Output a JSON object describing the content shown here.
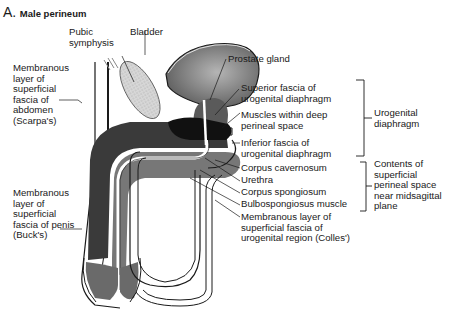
{
  "figure": {
    "letter": "A.",
    "title": "Male perineum"
  },
  "labels_left": {
    "pubic_symphysis": [
      "Pubic",
      "symphysis"
    ],
    "bladder": "Bladder",
    "scarpa": [
      "Membranous",
      "layer of",
      "superficial",
      "fascia of",
      "abdomen",
      "(Scarpa's)"
    ],
    "bucks": [
      "Membranous",
      "layer of",
      "superficial",
      "fascia of penis",
      "(Buck's)"
    ]
  },
  "labels_right": {
    "prostate": "Prostate gland",
    "superior_fascia": [
      "Superior fascia of",
      "urogenital diaphragm"
    ],
    "deep_muscles": [
      "Muscles within deep",
      "perineal space"
    ],
    "inferior_fascia": [
      "Inferior fascia of",
      "urogenital diaphragm"
    ],
    "corpus_cavernosum": "Corpus cavernosum",
    "urethra": "Urethra",
    "corpus_spongiosum": "Corpus spongiosum",
    "bulbospongiosus": "Bulbospongiosus muscle",
    "colles": [
      "Membranous layer of",
      "superficial fascia of",
      "urogenital region (Colles')"
    ]
  },
  "groups": {
    "urogenital_diaphragm": [
      "Urogenital",
      "diaphragm"
    ],
    "superficial_space": [
      "Contents of",
      "superficial",
      "perineal space",
      "near midsagittal",
      "plane"
    ]
  },
  "colors": {
    "bladder": "#6e6e6e",
    "prostate": "#5a5a5a",
    "deep_muscle": "#151515",
    "cavernosum": "#3a3a3a",
    "spongiosum": "#7a7a7a",
    "pubic": "#cfcfcf",
    "line": "#1a1a1a"
  }
}
